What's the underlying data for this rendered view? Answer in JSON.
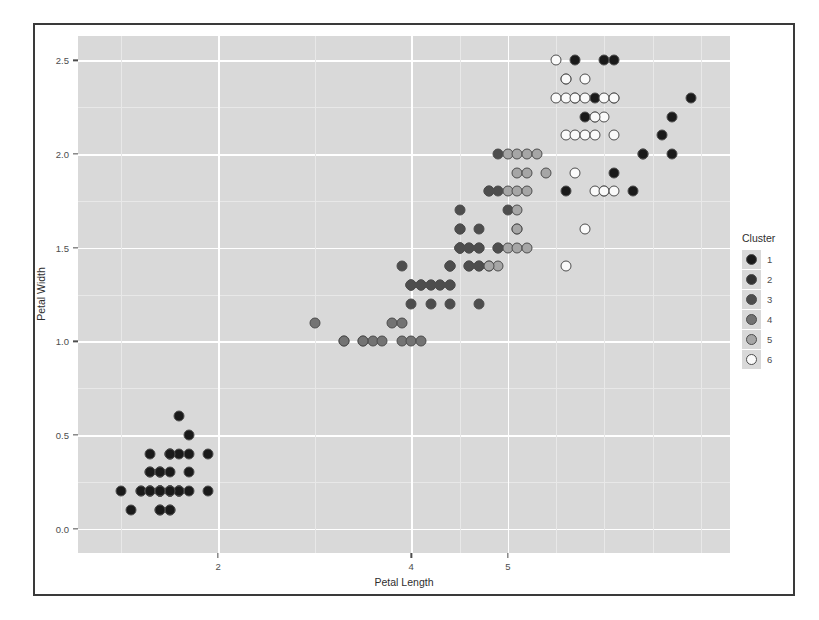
{
  "chart_data": {
    "type": "scatter",
    "title": "",
    "xlabel": "Petal Length",
    "ylabel": "Petal Width",
    "xlim": [
      0.55,
      7.3
    ],
    "ylim": [
      -0.13,
      2.63
    ],
    "xticks": [
      2,
      4,
      5
    ],
    "xticklabels": [
      "2",
      "4",
      "5"
    ],
    "yticks": [
      0.0,
      0.5,
      1.0,
      1.5,
      2.0,
      2.5
    ],
    "yticklabels": [
      "0.0",
      "0.5",
      "1.0",
      "1.5",
      "2.0",
      "2.5"
    ],
    "grid": true,
    "grid_color": "#ffffff",
    "panel_background": "#d9d9d9",
    "legend": {
      "title": "Cluster",
      "position": "right",
      "entries": [
        {
          "label": "1",
          "color": "#1a1a1a"
        },
        {
          "label": "2",
          "color": "#333333"
        },
        {
          "label": "3",
          "color": "#4d4d4d"
        },
        {
          "label": "4",
          "color": "#737373"
        },
        {
          "label": "5",
          "color": "#a6a6a6"
        },
        {
          "label": "6",
          "color": "#fafafa"
        }
      ]
    },
    "point_outline": "#4d4d4d",
    "series": [
      {
        "name": "1",
        "color": "#1a1a1a",
        "points": [
          [
            1.4,
            0.2
          ],
          [
            1.4,
            0.2
          ],
          [
            1.3,
            0.2
          ],
          [
            1.5,
            0.2
          ],
          [
            1.4,
            0.2
          ],
          [
            1.7,
            0.4
          ],
          [
            1.4,
            0.3
          ],
          [
            1.5,
            0.2
          ],
          [
            1.4,
            0.2
          ],
          [
            1.5,
            0.1
          ],
          [
            1.5,
            0.2
          ],
          [
            1.6,
            0.2
          ],
          [
            1.4,
            0.1
          ],
          [
            1.1,
            0.1
          ],
          [
            1.2,
            0.2
          ],
          [
            1.5,
            0.4
          ],
          [
            1.3,
            0.4
          ],
          [
            1.4,
            0.3
          ],
          [
            1.7,
            0.3
          ],
          [
            1.5,
            0.3
          ],
          [
            1.7,
            0.2
          ],
          [
            1.5,
            0.4
          ],
          [
            1.0,
            0.2
          ],
          [
            1.7,
            0.5
          ],
          [
            1.9,
            0.2
          ],
          [
            1.6,
            0.2
          ],
          [
            1.6,
            0.4
          ],
          [
            1.5,
            0.2
          ],
          [
            1.4,
            0.2
          ],
          [
            1.6,
            0.2
          ],
          [
            1.6,
            0.2
          ],
          [
            1.5,
            0.4
          ],
          [
            1.5,
            0.1
          ],
          [
            1.4,
            0.2
          ],
          [
            1.5,
            0.2
          ],
          [
            1.2,
            0.2
          ],
          [
            1.3,
            0.2
          ],
          [
            1.4,
            0.1
          ],
          [
            1.3,
            0.2
          ],
          [
            1.5,
            0.2
          ],
          [
            1.3,
            0.3
          ],
          [
            1.3,
            0.3
          ],
          [
            1.3,
            0.2
          ],
          [
            1.6,
            0.6
          ],
          [
            1.9,
            0.4
          ],
          [
            1.4,
            0.3
          ],
          [
            1.6,
            0.2
          ],
          [
            1.4,
            0.2
          ],
          [
            1.5,
            0.2
          ],
          [
            1.4,
            0.2
          ],
          [
            6.0,
            2.5
          ],
          [
            5.8,
            2.2
          ],
          [
            6.6,
            2.1
          ],
          [
            6.3,
            1.8
          ],
          [
            6.1,
            2.5
          ],
          [
            6.7,
            2.2
          ],
          [
            6.9,
            2.3
          ],
          [
            6.7,
            2.0
          ],
          [
            6.4,
            2.0
          ],
          [
            6.1,
            1.9
          ],
          [
            6.1,
            2.3
          ],
          [
            6.4,
            2.0
          ],
          [
            6.0,
            1.8
          ],
          [
            5.9,
            2.3
          ],
          [
            5.7,
            2.5
          ],
          [
            5.6,
            2.4
          ],
          [
            5.6,
            1.8
          ],
          [
            5.7,
            2.3
          ]
        ]
      },
      {
        "name": "3",
        "color": "#4d4d4d",
        "points": [
          [
            4.7,
            1.4
          ],
          [
            4.5,
            1.5
          ],
          [
            4.9,
            1.5
          ],
          [
            4.0,
            1.3
          ],
          [
            4.6,
            1.5
          ],
          [
            4.7,
            1.6
          ],
          [
            3.9,
            1.4
          ],
          [
            4.5,
            1.5
          ],
          [
            4.7,
            1.5
          ],
          [
            4.4,
            1.4
          ],
          [
            4.1,
            1.3
          ],
          [
            4.4,
            1.4
          ],
          [
            4.6,
            1.4
          ],
          [
            4.0,
            1.3
          ],
          [
            4.8,
            1.4
          ],
          [
            4.9,
            1.5
          ],
          [
            4.7,
            1.2
          ],
          [
            4.3,
            1.3
          ],
          [
            4.4,
            1.3
          ],
          [
            4.8,
            1.8
          ],
          [
            5.0,
            1.7
          ],
          [
            4.5,
            1.5
          ],
          [
            4.5,
            1.6
          ],
          [
            4.7,
            1.5
          ],
          [
            4.4,
            1.3
          ],
          [
            4.1,
            1.3
          ],
          [
            4.0,
            1.3
          ],
          [
            4.4,
            1.2
          ],
          [
            4.6,
            1.4
          ],
          [
            4.0,
            1.2
          ],
          [
            4.2,
            1.3
          ],
          [
            4.2,
            1.2
          ],
          [
            4.2,
            1.3
          ],
          [
            4.3,
            1.3
          ],
          [
            4.0,
            1.3
          ],
          [
            4.5,
            1.6
          ],
          [
            4.5,
            1.5
          ],
          [
            4.7,
            1.4
          ],
          [
            4.4,
            1.4
          ],
          [
            4.1,
            1.3
          ],
          [
            4.5,
            1.5
          ],
          [
            4.9,
            1.8
          ],
          [
            4.6,
            1.5
          ],
          [
            4.5,
            1.7
          ],
          [
            4.8,
            1.8
          ],
          [
            5.1,
            1.6
          ],
          [
            4.9,
            2.0
          ]
        ]
      },
      {
        "name": "4",
        "color": "#737373",
        "points": [
          [
            3.3,
            1.0
          ],
          [
            3.5,
            1.0
          ],
          [
            3.6,
            1.0
          ],
          [
            3.9,
            1.0
          ],
          [
            4.0,
            1.0
          ],
          [
            3.0,
            1.1
          ],
          [
            3.8,
            1.1
          ],
          [
            3.9,
            1.1
          ],
          [
            3.7,
            1.0
          ],
          [
            4.1,
            1.0
          ],
          [
            3.5,
            1.0
          ],
          [
            3.3,
            1.0
          ]
        ]
      },
      {
        "name": "5",
        "color": "#a6a6a6",
        "points": [
          [
            5.0,
            2.0
          ],
          [
            5.1,
            2.0
          ],
          [
            5.2,
            2.0
          ],
          [
            5.3,
            2.0
          ],
          [
            5.1,
            1.9
          ],
          [
            5.2,
            1.9
          ],
          [
            5.4,
            1.9
          ],
          [
            5.0,
            1.8
          ],
          [
            5.1,
            1.8
          ],
          [
            5.2,
            1.8
          ],
          [
            5.1,
            1.7
          ],
          [
            5.1,
            1.6
          ],
          [
            5.0,
            1.5
          ],
          [
            5.1,
            1.5
          ],
          [
            5.2,
            1.5
          ],
          [
            4.9,
            1.4
          ],
          [
            4.8,
            1.4
          ]
        ]
      },
      {
        "name": "6",
        "color": "#fafafa",
        "points": [
          [
            5.8,
            2.4
          ],
          [
            5.6,
            2.4
          ],
          [
            5.5,
            2.3
          ],
          [
            5.6,
            2.3
          ],
          [
            5.7,
            2.3
          ],
          [
            5.8,
            2.3
          ],
          [
            6.0,
            2.3
          ],
          [
            6.1,
            2.3
          ],
          [
            5.9,
            2.2
          ],
          [
            6.0,
            2.2
          ],
          [
            5.6,
            2.1
          ],
          [
            5.7,
            2.1
          ],
          [
            5.8,
            2.1
          ],
          [
            5.9,
            2.1
          ],
          [
            6.1,
            2.1
          ],
          [
            5.9,
            1.8
          ],
          [
            6.0,
            1.8
          ],
          [
            6.1,
            1.8
          ],
          [
            5.8,
            1.6
          ],
          [
            5.6,
            1.4
          ],
          [
            5.5,
            2.5
          ],
          [
            5.9,
            2.2
          ],
          [
            5.7,
            1.9
          ]
        ]
      }
    ]
  }
}
